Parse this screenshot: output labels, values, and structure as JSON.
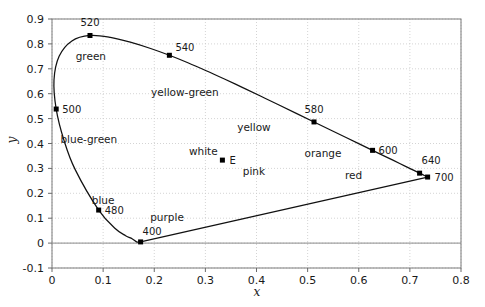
{
  "chart_data": {
    "type": "line",
    "title": "",
    "xlabel": "x",
    "ylabel": "y",
    "xlim": [
      0,
      0.8
    ],
    "ylim": [
      -0.1,
      0.9
    ],
    "grid": true,
    "legend": "none",
    "xticks": [
      "0",
      "0.1",
      "0.2",
      "0.3",
      "0.4",
      "0.5",
      "0.6",
      "0.7",
      "0.8"
    ],
    "xtick_values": [
      0,
      0.1,
      0.2,
      0.3,
      0.4,
      0.5,
      0.6,
      0.7,
      0.8
    ],
    "yticks": [
      "-0.1",
      "0",
      "0.1",
      "0.2",
      "0.3",
      "0.4",
      "0.5",
      "0.6",
      "0.7",
      "0.8",
      "0.9"
    ],
    "ytick_values": [
      -0.1,
      0,
      0.1,
      0.2,
      0.3,
      0.4,
      0.5,
      0.6,
      0.7,
      0.8,
      0.9
    ],
    "series": [
      {
        "name": "spectral-locus",
        "description": "CIE 1931 spectral locus from 400 nm to 700 nm",
        "x": [
          0.1733,
          0.173,
          0.1721,
          0.1703,
          0.1655,
          0.1566,
          0.144,
          0.1241,
          0.0913,
          0.0454,
          0.0235,
          0.0082,
          0.0039,
          0.0139,
          0.0389,
          0.0743,
          0.1142,
          0.1547,
          0.1929,
          0.2296,
          0.2658,
          0.3016,
          0.3373,
          0.3731,
          0.4087,
          0.4441,
          0.4788,
          0.5125,
          0.5448,
          0.5752,
          0.6029,
          0.627,
          0.6482,
          0.6658,
          0.6801,
          0.6915,
          0.7006,
          0.7079,
          0.714,
          0.719,
          0.723,
          0.726,
          0.7283,
          0.73,
          0.7311,
          0.732,
          0.7327,
          0.7334,
          0.734,
          0.7347
        ],
        "y": [
          0.0048,
          0.0048,
          0.0048,
          0.0048,
          0.0051,
          0.0177,
          0.0297,
          0.0578,
          0.1327,
          0.295,
          0.4127,
          0.5384,
          0.6548,
          0.7502,
          0.812,
          0.8338,
          0.8262,
          0.8059,
          0.7816,
          0.7543,
          0.7243,
          0.6923,
          0.6589,
          0.6245,
          0.5896,
          0.5547,
          0.5202,
          0.4866,
          0.4544,
          0.4242,
          0.3965,
          0.3725,
          0.3514,
          0.334,
          0.3197,
          0.3083,
          0.2993,
          0.292,
          0.2859,
          0.2809,
          0.277,
          0.274,
          0.2717,
          0.27,
          0.2689,
          0.268,
          0.2673,
          0.2666,
          0.266,
          0.2653
        ]
      },
      {
        "name": "purple-line",
        "description": "Line of purples connecting 400 nm to 700 nm",
        "x": [
          0.1733,
          0.7347
        ],
        "y": [
          0.0048,
          0.2653
        ]
      }
    ],
    "points": [
      {
        "label": "400",
        "x": 0.1733,
        "y": 0.0048,
        "label_dx": 2,
        "label_dy": -7
      },
      {
        "label": "480",
        "x": 0.0913,
        "y": 0.1327,
        "label_dx": 6,
        "label_dy": 4
      },
      {
        "label": "500",
        "x": 0.0082,
        "y": 0.5384,
        "label_dx": 6,
        "label_dy": 4
      },
      {
        "label": "520",
        "x": 0.0743,
        "y": 0.8338,
        "label_dx": 0,
        "label_dy": -9
      },
      {
        "label": "540",
        "x": 0.2296,
        "y": 0.7543,
        "label_dx": 6,
        "label_dy": -4
      },
      {
        "label": "580",
        "x": 0.5125,
        "y": 0.4866,
        "label_dx": 0,
        "label_dy": -9
      },
      {
        "label": "600",
        "x": 0.627,
        "y": 0.3725,
        "label_dx": 6,
        "label_dy": 4
      },
      {
        "label": "640",
        "x": 0.719,
        "y": 0.2809,
        "label_dx": 2,
        "label_dy": -9
      },
      {
        "label": "700",
        "x": 0.7347,
        "y": 0.2653,
        "label_dx": 7,
        "label_dy": 4
      },
      {
        "label": "E",
        "x": 0.3333,
        "y": 0.3333,
        "label_dx": 7,
        "label_dy": 4
      }
    ],
    "annotations": [
      {
        "text": "green",
        "x": 0.076,
        "y": 0.75
      },
      {
        "text": "yellow-green",
        "x": 0.26,
        "y": 0.605
      },
      {
        "text": "yellow",
        "x": 0.395,
        "y": 0.465
      },
      {
        "text": "orange",
        "x": 0.53,
        "y": 0.36
      },
      {
        "text": "blue-green",
        "x": 0.072,
        "y": 0.42
      },
      {
        "text": "white",
        "x": 0.296,
        "y": 0.368
      },
      {
        "text": "pink",
        "x": 0.395,
        "y": 0.29
      },
      {
        "text": "red",
        "x": 0.59,
        "y": 0.275
      },
      {
        "text": "blue",
        "x": 0.1,
        "y": 0.175
      },
      {
        "text": "purple",
        "x": 0.225,
        "y": 0.105
      }
    ]
  }
}
